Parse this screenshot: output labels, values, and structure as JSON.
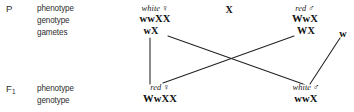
{
  "diagram": {
    "cross_operator": "X",
    "generations": [
      {
        "marker": "P",
        "marker_sub": "",
        "rows": [
          "phenotype",
          "genotype",
          "gametes"
        ]
      },
      {
        "marker": "F",
        "marker_sub": "1",
        "rows": [
          "phenotype",
          "genotype"
        ]
      }
    ],
    "parents": {
      "left": {
        "phenotype": "white",
        "sex": "♀",
        "genotype": "wwXX",
        "gametes": [
          "wX"
        ]
      },
      "right": {
        "phenotype": "red",
        "sex": "♂",
        "genotype": "WwX",
        "gametes": [
          "WX",
          "w"
        ]
      }
    },
    "offspring": {
      "left": {
        "phenotype": "red",
        "sex": "♀",
        "genotype": "WwXX"
      },
      "right": {
        "phenotype": "white",
        "sex": "♂",
        "genotype": "wwX"
      }
    },
    "colors": {
      "background": "#ffffff",
      "text": "#1a1a1a",
      "line": "#222222"
    }
  }
}
